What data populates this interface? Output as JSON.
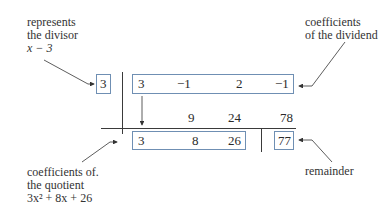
{
  "annotations": {
    "divisor": {
      "line1": "represents",
      "line2": "the divisor",
      "line3": "x − 3"
    },
    "dividend": {
      "line1": "coefficients",
      "line2": "of the dividend"
    },
    "quotient": {
      "line1": "coefficients of.",
      "line2": "the quotient",
      "line3": "3x² + 8x + 26"
    },
    "remainder": {
      "line1": "remainder"
    }
  },
  "synthetic_division": {
    "divisor": "3",
    "dividend": [
      "3",
      "−1",
      "2",
      "−1"
    ],
    "products": [
      "9",
      "24",
      "78"
    ],
    "quotient": [
      "3",
      "8",
      "26"
    ],
    "remainder": "77"
  },
  "colors": {
    "box_border": "#6f8fb3",
    "rule": "#3a3a3a"
  }
}
